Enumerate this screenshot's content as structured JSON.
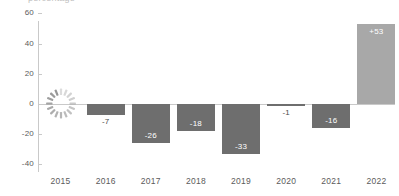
{
  "title_fragment": "percentage",
  "chart_data": {
    "type": "bar",
    "title": "",
    "xlabel": "",
    "ylabel": "",
    "ylim": [
      -40,
      60
    ],
    "yticks": [
      60,
      40,
      20,
      0,
      -20,
      -40
    ],
    "ytick_labels": [
      "60",
      "40",
      "20",
      "0",
      "-20",
      "-40"
    ],
    "grid": false,
    "legend": "none",
    "zero_line": true,
    "categories": [
      "2015",
      "2016",
      "2017",
      "2018",
      "2019",
      "2020",
      "2021",
      "2022"
    ],
    "values": [
      null,
      -7,
      -26,
      -18,
      -33,
      -1,
      -16,
      53
    ],
    "data_labels": [
      "",
      "-7",
      "-26",
      "-18",
      "-33",
      "-1",
      "-16",
      "+53"
    ],
    "bars": [
      {
        "category": "2015",
        "value": null,
        "label": "",
        "label_placement": "none",
        "state": "loading",
        "color": ""
      },
      {
        "category": "2016",
        "value": -7,
        "label": "-7",
        "label_placement": "outside",
        "state": "data",
        "color": "#6e6e6e"
      },
      {
        "category": "2017",
        "value": -26,
        "label": "-26",
        "label_placement": "inside",
        "state": "data",
        "color": "#6e6e6e"
      },
      {
        "category": "2018",
        "value": -18,
        "label": "-18",
        "label_placement": "inside",
        "state": "data",
        "color": "#6e6e6e"
      },
      {
        "category": "2019",
        "value": -33,
        "label": "-33",
        "label_placement": "inside",
        "state": "data",
        "color": "#6e6e6e"
      },
      {
        "category": "2020",
        "value": -1,
        "label": "-1",
        "label_placement": "outside",
        "state": "data",
        "color": "#6e6e6e"
      },
      {
        "category": "2021",
        "value": -16,
        "label": "-16",
        "label_placement": "inside",
        "state": "data",
        "color": "#6e6e6e"
      },
      {
        "category": "2022",
        "value": 53,
        "label": "+53",
        "label_placement": "inside",
        "state": "data",
        "color": "#a8a8a8"
      }
    ],
    "colors": {
      "negative_bar": "#6e6e6e",
      "positive_bar": "#a8a8a8",
      "axis": "#c9c9c9",
      "text": "#5b5b5b",
      "inside_label": "#ffffff",
      "spinner": "#8c8c8c",
      "background": "#ffffff"
    }
  },
  "loading_indicator": {
    "name": "loading-spinner",
    "category": "2015",
    "segments": 16
  }
}
